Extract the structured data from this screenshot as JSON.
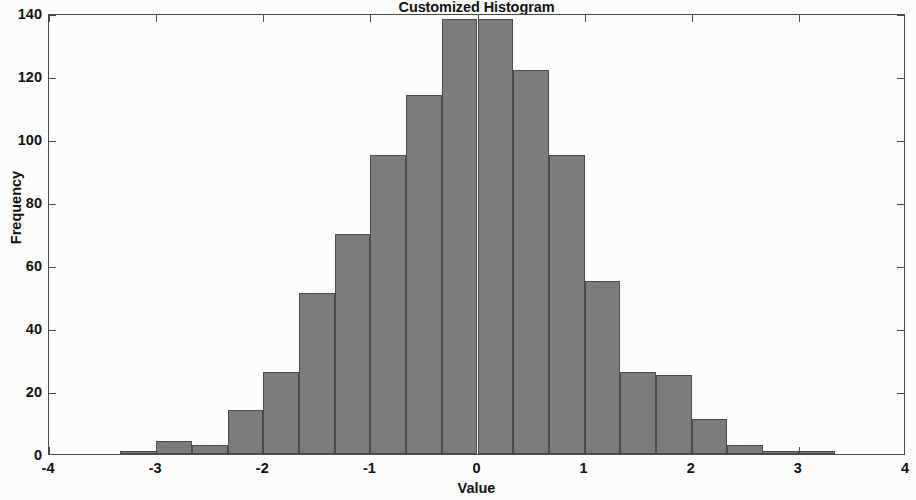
{
  "chart_data": {
    "type": "bar",
    "title": "Customized Histogram",
    "xlabel": "Value",
    "ylabel": "Frequency",
    "xlim": [
      -4,
      4
    ],
    "ylim": [
      0,
      140
    ],
    "grid": false,
    "legend": null,
    "bin_width": 0.3333,
    "bar_color": "#7d7d7d",
    "bar_edge_color": "#4c4c4c",
    "xticks": [
      -4,
      -3,
      -2,
      -1,
      0,
      1,
      2,
      3,
      4
    ],
    "xtick_labels": [
      "-4",
      "-3",
      "-2",
      "-1",
      "0",
      "1",
      "2",
      "3",
      "4"
    ],
    "yticks": [
      0,
      20,
      40,
      60,
      80,
      100,
      120,
      140
    ],
    "ytick_labels": [
      "0",
      "20",
      "40",
      "60",
      "80",
      "100",
      "120",
      "140"
    ],
    "bin_edges": [
      -4.0,
      -3.6667,
      -3.3333,
      -3.0,
      -2.6667,
      -2.3333,
      -2.0,
      -1.6667,
      -1.3333,
      -1.0,
      -0.6667,
      -0.3333,
      0.0,
      0.3333,
      0.6667,
      1.0,
      1.3333,
      1.6667,
      2.0,
      2.3333,
      2.6667,
      3.0,
      3.3333,
      3.6667,
      4.0
    ],
    "bin_centers": [
      -3.833,
      -3.5,
      -3.167,
      -2.833,
      -2.5,
      -2.167,
      -1.833,
      -1.5,
      -1.167,
      -0.833,
      -0.5,
      -0.167,
      0.167,
      0.5,
      0.833,
      1.167,
      1.5,
      1.833,
      2.167,
      2.5,
      2.833,
      3.167,
      3.5,
      3.833
    ],
    "values": [
      0,
      0,
      1,
      4,
      3,
      14,
      26,
      51,
      70,
      95,
      114,
      138,
      138,
      122,
      95,
      55,
      26,
      25,
      11,
      3,
      1,
      1,
      0,
      0
    ]
  }
}
